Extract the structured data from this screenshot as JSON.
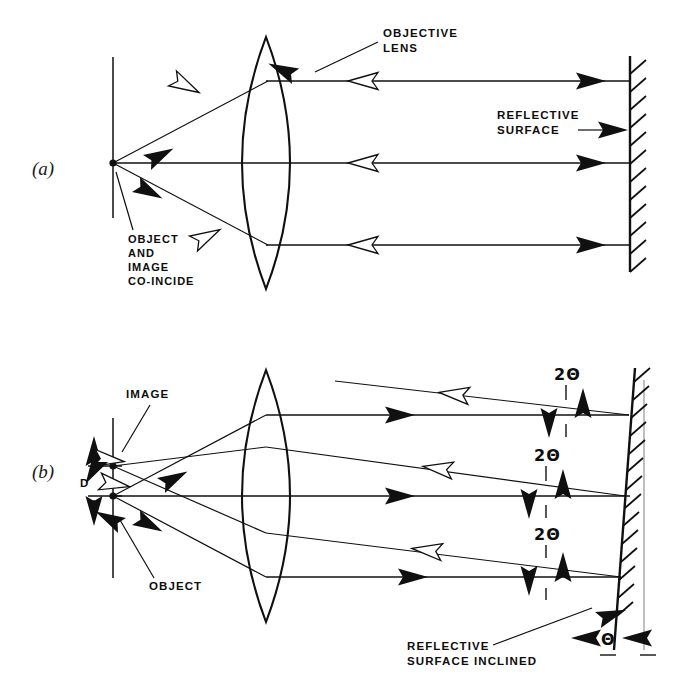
{
  "figure": {
    "panels": [
      {
        "id": "a",
        "panel_label": "(a)",
        "labels": {
          "objective_lens": "OBJECTIVE\nLENS",
          "objective_lens_line1": "OBJECTIVE",
          "objective_lens_line2": "LENS",
          "reflective_surface_line1": "REFLECTIVE",
          "reflective_surface_line2": "SURFACE",
          "object_image_line1": "OBJECT",
          "object_image_line2": "AND",
          "object_image_line3": "IMAGE",
          "object_image_line4": "CO-INCIDE"
        }
      },
      {
        "id": "b",
        "panel_label": "(b)",
        "labels": {
          "image": "IMAGE",
          "object": "OBJECT",
          "separation": "D",
          "angle_top": "2Θ",
          "angle_middle": "2Θ",
          "angle_bottom": "2Θ",
          "tilt_angle": "Θ",
          "reflective_surface_inclined_line1": "REFLECTIVE",
          "reflective_surface_inclined_line2": "SURFACE INCLINED"
        }
      }
    ],
    "colors": {
      "ink": "#101010",
      "paper": "#ffffff",
      "ghost_line": "#8a8a8a"
    },
    "icons": {
      "solid_arrow": "solid-arrowhead",
      "hollow_arrow": "hollow-arrowhead",
      "hatching": "hatch-marks"
    }
  }
}
